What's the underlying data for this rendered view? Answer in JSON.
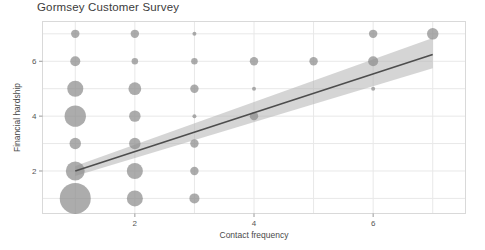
{
  "chart_data": {
    "type": "scatter",
    "title": "Gormsey Customer Survey",
    "xlabel": "Contact frequency",
    "ylabel": "Financial hardship",
    "xlim": [
      0.45,
      7.55
    ],
    "ylim": [
      0.45,
      7.45
    ],
    "xticks": [
      2,
      4,
      6
    ],
    "yticks": [
      2,
      4,
      6
    ],
    "xtick_labels": [
      "2",
      "4",
      "6"
    ],
    "ytick_labels": [
      "2",
      "4",
      "6"
    ],
    "grid": true,
    "legend": null,
    "point_color": "#8c8c8c",
    "line_color": "#4d4d4d",
    "band_color": "#b3b3b3",
    "grid_color": "#e8e8e8",
    "frame_color": "#d9d9d9",
    "background": "#ffffff",
    "size_encoding": "count",
    "points": [
      {
        "x": 1,
        "y": 7,
        "count": 3
      },
      {
        "x": 1,
        "y": 6,
        "count": 4
      },
      {
        "x": 1,
        "y": 5,
        "count": 9
      },
      {
        "x": 1,
        "y": 4,
        "count": 15
      },
      {
        "x": 1,
        "y": 3,
        "count": 5
      },
      {
        "x": 1,
        "y": 2,
        "count": 12
      },
      {
        "x": 1,
        "y": 1,
        "count": 30
      },
      {
        "x": 2,
        "y": 7,
        "count": 3
      },
      {
        "x": 2,
        "y": 6,
        "count": 2
      },
      {
        "x": 2,
        "y": 5,
        "count": 6
      },
      {
        "x": 2,
        "y": 4,
        "count": 5
      },
      {
        "x": 2,
        "y": 3,
        "count": 5
      },
      {
        "x": 2,
        "y": 2,
        "count": 9
      },
      {
        "x": 2,
        "y": 1,
        "count": 9
      },
      {
        "x": 3,
        "y": 7,
        "count": 1
      },
      {
        "x": 3,
        "y": 6,
        "count": 2
      },
      {
        "x": 3,
        "y": 5,
        "count": 3
      },
      {
        "x": 3,
        "y": 4,
        "count": 1
      },
      {
        "x": 3,
        "y": 3,
        "count": 3
      },
      {
        "x": 3,
        "y": 2,
        "count": 3
      },
      {
        "x": 3,
        "y": 1,
        "count": 4
      },
      {
        "x": 4,
        "y": 6,
        "count": 3
      },
      {
        "x": 4,
        "y": 5,
        "count": 1
      },
      {
        "x": 4,
        "y": 4,
        "count": 3
      },
      {
        "x": 5,
        "y": 6,
        "count": 3
      },
      {
        "x": 6,
        "y": 7,
        "count": 3
      },
      {
        "x": 6,
        "y": 6,
        "count": 4
      },
      {
        "x": 6,
        "y": 5,
        "count": 1
      },
      {
        "x": 7,
        "y": 7,
        "count": 5
      }
    ],
    "regression": {
      "label": "linear fit",
      "x_start": 1,
      "x_end": 7,
      "y_start": 2.0,
      "y_end": 6.25,
      "band_lower_start": 1.82,
      "band_upper_start": 2.18,
      "band_lower_end": 5.75,
      "band_upper_end": 6.85
    }
  }
}
